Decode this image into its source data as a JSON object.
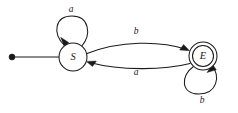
{
  "diagram": {
    "type": "finite-state-machine",
    "alphabet": [
      "a",
      "b"
    ],
    "colors": {
      "ink": "#1a1a1a",
      "background": "#ffffff"
    },
    "states": [
      {
        "id": "S",
        "label": "S",
        "role": "start",
        "accepting": false,
        "x": 73,
        "y": 57,
        "radius": 14
      },
      {
        "id": "E",
        "label": "E",
        "role": "accepting",
        "accepting": true,
        "x": 203,
        "y": 56,
        "radius": 14,
        "inner_radius": 10.5
      }
    ],
    "start_marker": {
      "name": "start-arrow",
      "dot_x": 12,
      "dot_y": 57,
      "line_end_x": 59
    },
    "transitions": [
      {
        "id": "S-self",
        "from": "S",
        "to": "S",
        "label": "a",
        "kind": "self-loop",
        "loop_side": "top",
        "label_x": 71,
        "label_y": 10
      },
      {
        "id": "S-to-E",
        "from": "S",
        "to": "E",
        "label": "b",
        "kind": "curve",
        "curve_side": "top",
        "label_x": 136,
        "label_y": 32
      },
      {
        "id": "E-to-S",
        "from": "E",
        "to": "S",
        "label": "a",
        "kind": "curve",
        "curve_side": "bottom",
        "label_x": 136,
        "label_y": 73
      },
      {
        "id": "E-self",
        "from": "E",
        "to": "E",
        "label": "b",
        "kind": "self-loop",
        "loop_side": "bottom",
        "label_x": 202,
        "label_y": 101
      }
    ]
  }
}
